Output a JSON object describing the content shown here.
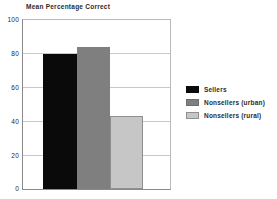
{
  "chart_data": {
    "type": "bar",
    "title": "Mean Percentage Correct",
    "xlabel": "",
    "ylabel": "",
    "categories": [
      "Sellers",
      "Nonsellers (urban)",
      "Nonsellers (rural)"
    ],
    "values": [
      80,
      84,
      43.5
    ],
    "ylim": [
      0,
      100
    ],
    "yticks": [
      0,
      20,
      40,
      60,
      80,
      100
    ],
    "ytick_labels": [
      "0",
      "20",
      "40",
      "60",
      "80",
      "100"
    ],
    "grid": true,
    "legend_position": "right",
    "series": [
      {
        "name": "Sellers",
        "value": 80,
        "color": "#0a0a0a"
      },
      {
        "name": "Nonsellers (urban)",
        "value": 84,
        "color": "#7f7f7f"
      },
      {
        "name": "Nonsellers (rural)",
        "value": 43.5,
        "color": "#c6c6c6"
      }
    ]
  },
  "legend": {
    "items": [
      {
        "label": "Sellers",
        "color": "#0a0a0a",
        "border": "#0a0a0a"
      },
      {
        "label": "Nonsellers (urban)",
        "color": "#7f7f7f",
        "border": "#6d6d6d"
      },
      {
        "label": "Nonsellers (rural)",
        "color": "#c6c6c6",
        "border": "#8f8f8f"
      }
    ]
  },
  "axis": {
    "tick_0": "0",
    "tick_20": "20",
    "tick_40": "40",
    "tick_60": "60",
    "tick_80": "80",
    "tick_100": "100"
  }
}
